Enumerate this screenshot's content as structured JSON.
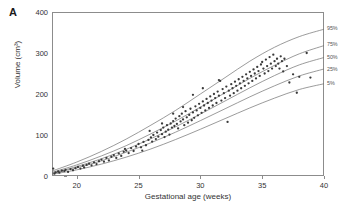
{
  "figure": {
    "panel_label": "A",
    "background": "#ffffff"
  },
  "chart_data": {
    "type": "scatter",
    "title": "",
    "subtitle": "",
    "xlabel": "Gestational age (weeks)",
    "ylabel": "Volume (cm³)",
    "xlim": [
      18,
      40
    ],
    "ylim": [
      0,
      400
    ],
    "xticks": [
      20,
      25,
      30,
      35,
      40
    ],
    "xtick_labels": [
      "20",
      "25",
      "30",
      "35",
      "40"
    ],
    "yticks": [
      0,
      100,
      200,
      300,
      400
    ],
    "ytick_labels": [
      "0",
      "100",
      "200",
      "300",
      "400"
    ],
    "grid": false,
    "legend_position": "right-inline-curve-labels",
    "point_color": "#3a3a3a",
    "curve_color": "#707070",
    "frame_color": "#8c8c8c",
    "curves": [
      {
        "name": "95%",
        "label": "95%",
        "label_x": 40.0,
        "label_y": 360,
        "x": [
          18,
          20,
          22,
          24,
          26,
          28,
          30,
          32,
          34,
          36,
          38,
          40
        ],
        "y": [
          12,
          34,
          60,
          90,
          124,
          160,
          200,
          240,
          280,
          314,
          340,
          358
        ]
      },
      {
        "name": "75%",
        "label": "75%",
        "label_x": 40.0,
        "label_y": 322,
        "x": [
          18,
          20,
          22,
          24,
          26,
          28,
          30,
          32,
          34,
          36,
          38,
          40
        ],
        "y": [
          9,
          27,
          49,
          74,
          103,
          134,
          168,
          203,
          238,
          270,
          298,
          318
        ]
      },
      {
        "name": "50%",
        "label": "50%",
        "label_x": 40.0,
        "label_y": 290,
        "x": [
          18,
          20,
          22,
          24,
          26,
          28,
          30,
          32,
          34,
          36,
          38,
          40
        ],
        "y": [
          7,
          23,
          42,
          65,
          91,
          120,
          151,
          183,
          215,
          245,
          271,
          289
        ]
      },
      {
        "name": "25%",
        "label": "25%",
        "label_x": 40.0,
        "label_y": 262,
        "x": [
          18,
          20,
          22,
          24,
          26,
          28,
          30,
          32,
          34,
          36,
          38,
          40
        ],
        "y": [
          6,
          20,
          37,
          58,
          81,
          107,
          135,
          164,
          193,
          220,
          244,
          261
        ]
      },
      {
        "name": "5%",
        "label": "5%",
        "label_x": 40.0,
        "label_y": 226,
        "x": [
          18,
          20,
          22,
          24,
          26,
          28,
          30,
          32,
          34,
          36,
          38,
          40
        ],
        "y": [
          4,
          15,
          29,
          46,
          66,
          89,
          114,
          140,
          166,
          190,
          211,
          225
        ]
      }
    ],
    "points": [
      [
        18.1,
        18
      ],
      [
        18.2,
        6
      ],
      [
        18.3,
        9
      ],
      [
        18.5,
        11
      ],
      [
        18.6,
        8
      ],
      [
        18.8,
        13
      ],
      [
        19.0,
        12
      ],
      [
        19.1,
        15
      ],
      [
        19.3,
        10
      ],
      [
        19.5,
        17
      ],
      [
        19.7,
        14
      ],
      [
        19.9,
        19
      ],
      [
        20.1,
        22
      ],
      [
        20.3,
        18
      ],
      [
        20.5,
        25
      ],
      [
        20.6,
        21
      ],
      [
        20.8,
        27
      ],
      [
        21.0,
        30
      ],
      [
        21.2,
        26
      ],
      [
        21.4,
        33
      ],
      [
        21.6,
        29
      ],
      [
        21.8,
        36
      ],
      [
        22.0,
        40
      ],
      [
        22.2,
        35
      ],
      [
        22.4,
        44
      ],
      [
        22.6,
        38
      ],
      [
        22.8,
        47
      ],
      [
        23.0,
        51
      ],
      [
        23.2,
        44
      ],
      [
        23.4,
        55
      ],
      [
        23.6,
        49
      ],
      [
        23.8,
        59
      ],
      [
        23.9,
        66
      ],
      [
        24.0,
        62
      ],
      [
        24.2,
        56
      ],
      [
        24.4,
        68
      ],
      [
        24.6,
        61
      ],
      [
        24.8,
        72
      ],
      [
        25.0,
        78
      ],
      [
        25.2,
        70
      ],
      [
        25.3,
        62
      ],
      [
        25.4,
        83
      ],
      [
        25.6,
        75
      ],
      [
        25.8,
        88
      ],
      [
        26.0,
        94
      ],
      [
        26.1,
        84
      ],
      [
        26.2,
        100
      ],
      [
        26.4,
        90
      ],
      [
        26.5,
        106
      ],
      [
        26.6,
        96
      ],
      [
        26.8,
        112
      ],
      [
        26.9,
        102
      ],
      [
        27.0,
        118
      ],
      [
        27.1,
        95
      ],
      [
        27.2,
        108
      ],
      [
        27.3,
        124
      ],
      [
        27.4,
        113
      ],
      [
        27.5,
        101
      ],
      [
        27.6,
        128
      ],
      [
        27.7,
        118
      ],
      [
        27.8,
        134
      ],
      [
        27.9,
        122
      ],
      [
        28.0,
        140
      ],
      [
        28.1,
        127
      ],
      [
        28.2,
        116
      ],
      [
        28.3,
        146
      ],
      [
        28.4,
        133
      ],
      [
        28.5,
        152
      ],
      [
        28.6,
        138
      ],
      [
        28.7,
        124
      ],
      [
        28.8,
        158
      ],
      [
        28.9,
        143
      ],
      [
        29.0,
        130
      ],
      [
        29.1,
        149
      ],
      [
        29.2,
        164
      ],
      [
        29.3,
        136
      ],
      [
        29.4,
        155
      ],
      [
        29.5,
        142
      ],
      [
        29.6,
        170
      ],
      [
        29.7,
        160
      ],
      [
        29.8,
        148
      ],
      [
        29.9,
        176
      ],
      [
        30.0,
        166
      ],
      [
        30.1,
        154
      ],
      [
        30.2,
        182
      ],
      [
        30.3,
        172
      ],
      [
        30.4,
        160
      ],
      [
        30.5,
        188
      ],
      [
        30.6,
        178
      ],
      [
        30.7,
        166
      ],
      [
        30.8,
        194
      ],
      [
        30.9,
        184
      ],
      [
        31.0,
        172
      ],
      [
        31.1,
        200
      ],
      [
        31.2,
        190
      ],
      [
        31.3,
        178
      ],
      [
        31.4,
        206
      ],
      [
        31.5,
        196
      ],
      [
        31.6,
        232
      ],
      [
        31.7,
        184
      ],
      [
        31.8,
        212
      ],
      [
        31.9,
        202
      ],
      [
        32.0,
        190
      ],
      [
        32.1,
        218
      ],
      [
        32.2,
        132
      ],
      [
        32.3,
        208
      ],
      [
        32.4,
        196
      ],
      [
        32.5,
        224
      ],
      [
        32.6,
        214
      ],
      [
        32.7,
        202
      ],
      [
        32.8,
        230
      ],
      [
        32.9,
        220
      ],
      [
        33.0,
        208
      ],
      [
        33.1,
        236
      ],
      [
        33.2,
        226
      ],
      [
        33.3,
        214
      ],
      [
        33.4,
        242
      ],
      [
        33.5,
        232
      ],
      [
        33.6,
        220
      ],
      [
        33.7,
        248
      ],
      [
        33.8,
        238
      ],
      [
        33.9,
        226
      ],
      [
        34.0,
        254
      ],
      [
        34.1,
        244
      ],
      [
        34.2,
        232
      ],
      [
        34.3,
        260
      ],
      [
        34.4,
        250
      ],
      [
        34.5,
        238
      ],
      [
        34.6,
        266
      ],
      [
        34.7,
        256
      ],
      [
        34.8,
        244
      ],
      [
        34.9,
        272
      ],
      [
        35.0,
        278
      ],
      [
        35.1,
        262
      ],
      [
        35.2,
        250
      ],
      [
        35.3,
        284
      ],
      [
        35.4,
        268
      ],
      [
        35.5,
        256
      ],
      [
        35.6,
        290
      ],
      [
        35.7,
        274
      ],
      [
        35.8,
        262
      ],
      [
        35.9,
        296
      ],
      [
        36.0,
        280
      ],
      [
        36.1,
        268
      ],
      [
        36.2,
        286
      ],
      [
        36.3,
        274
      ],
      [
        36.4,
        262
      ],
      [
        36.5,
        292
      ],
      [
        36.6,
        280
      ],
      [
        36.7,
        255
      ],
      [
        36.8,
        286
      ],
      [
        37.0,
        268
      ],
      [
        37.2,
        228
      ],
      [
        37.5,
        248
      ],
      [
        37.8,
        203
      ],
      [
        38.0,
        242
      ],
      [
        38.6,
        300
      ],
      [
        38.9,
        240
      ],
      [
        31.5,
        234
      ],
      [
        30.2,
        214
      ],
      [
        29.4,
        198
      ],
      [
        28.6,
        168
      ],
      [
        27.8,
        152
      ],
      [
        26.9,
        128
      ],
      [
        25.9,
        110
      ]
    ]
  }
}
